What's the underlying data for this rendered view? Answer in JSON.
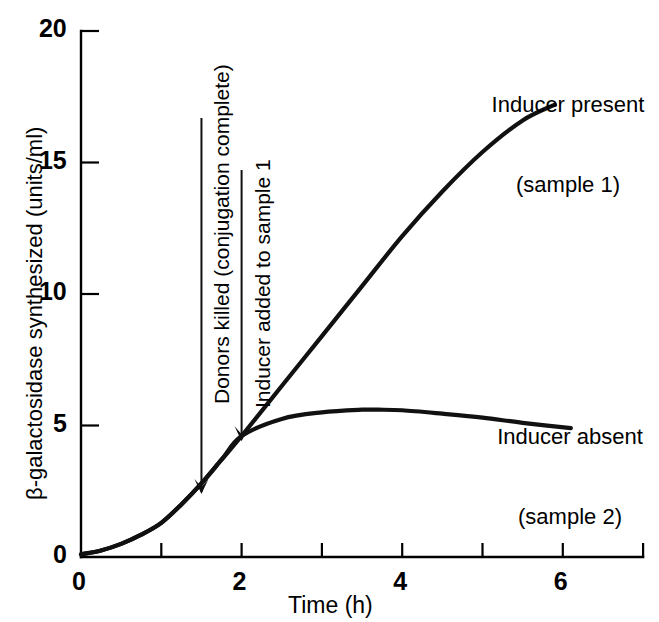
{
  "chart_data": {
    "type": "line",
    "title": "",
    "xlabel": "Time (h)",
    "ylabel": "β-galactosidase synthesized (units/ml)",
    "xlim": [
      0,
      7
    ],
    "ylim": [
      0,
      20
    ],
    "grid": false,
    "legend_position": "inline-right",
    "x_ticks": [
      0,
      1,
      2,
      3,
      4,
      5,
      6,
      7
    ],
    "x_tick_labels": [
      "0",
      "",
      "2",
      "",
      "4",
      "",
      "6",
      ""
    ],
    "y_ticks": [
      0,
      5,
      10,
      15,
      20
    ],
    "y_tick_labels": [
      "0",
      "5",
      "10",
      "15",
      "20"
    ],
    "series": [
      {
        "name": "Inducer present (sample 1)",
        "x": [
          0.0,
          0.25,
          0.5,
          0.75,
          1.0,
          1.25,
          1.5,
          1.75,
          2.0,
          2.5,
          3.0,
          3.5,
          4.0,
          4.5,
          5.0,
          5.5,
          5.9
        ],
        "values": [
          0.1,
          0.25,
          0.5,
          0.85,
          1.3,
          2.0,
          2.8,
          3.7,
          4.6,
          6.5,
          8.4,
          10.3,
          12.2,
          13.9,
          15.4,
          16.6,
          17.2
        ]
      },
      {
        "name": "Inducer absent (sample 2)",
        "x": [
          0.0,
          0.25,
          0.5,
          0.75,
          1.0,
          1.25,
          1.5,
          1.75,
          2.0,
          2.5,
          3.0,
          3.5,
          3.7,
          4.0,
          4.5,
          5.0,
          5.5,
          6.1
        ],
        "values": [
          0.1,
          0.25,
          0.5,
          0.85,
          1.3,
          2.0,
          2.8,
          3.7,
          4.6,
          5.25,
          5.5,
          5.6,
          5.6,
          5.58,
          5.45,
          5.3,
          5.1,
          4.9
        ]
      }
    ],
    "branch_point": {
      "x": 2.0,
      "y": 4.6
    },
    "annotations": [
      {
        "id": "donors-killed",
        "text": "Donors killed (conjugation complete)",
        "arrow_x": 1.5,
        "arrow_tip_y": 2.4,
        "orientation": "vertical-up"
      },
      {
        "id": "inducer-added",
        "text": "Inducer added to sample 1",
        "arrow_x": 2.0,
        "arrow_tip_y": 4.4,
        "orientation": "vertical-up"
      }
    ],
    "series_labels": [
      {
        "id": "sample-1",
        "line1": "Inducer present",
        "line2": "(sample 1)"
      },
      {
        "id": "sample-2",
        "line1": "Inducer absent",
        "line2": "(sample 2)"
      }
    ]
  },
  "colors": {
    "ink": "#111111",
    "axis": "#000000",
    "background": "#ffffff"
  }
}
